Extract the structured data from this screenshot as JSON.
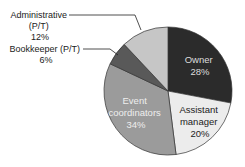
{
  "chart_data": {
    "type": "pie",
    "title": "",
    "start_angle": "12 o'clock, clockwise",
    "categories": [
      "Owner",
      "Assistant manager",
      "Event coordinators",
      "Bookkeeper (P/T)",
      "Administrative (P/T)"
    ],
    "values": [
      28,
      20,
      34,
      6,
      12
    ],
    "unit": "%",
    "colors": [
      "#2b2b2b",
      "#ececec",
      "#9b9b9b",
      "#595959",
      "#c6c6c6"
    ],
    "labels": {
      "owner": {
        "line1": "Owner",
        "line2": "28%"
      },
      "assistant": {
        "line1": "Assistant",
        "line2": "manager",
        "line3": "20%"
      },
      "event": {
        "line1": "Event",
        "line2": "coordinators",
        "line3": "34%"
      },
      "bookkeeper": {
        "line1": "Bookkeeper (P/T)",
        "line2": "6%"
      },
      "admin": {
        "line1": "Administrative",
        "line2": "(P/T)",
        "line3": "12%"
      }
    },
    "legend": "none (callout labels)"
  }
}
